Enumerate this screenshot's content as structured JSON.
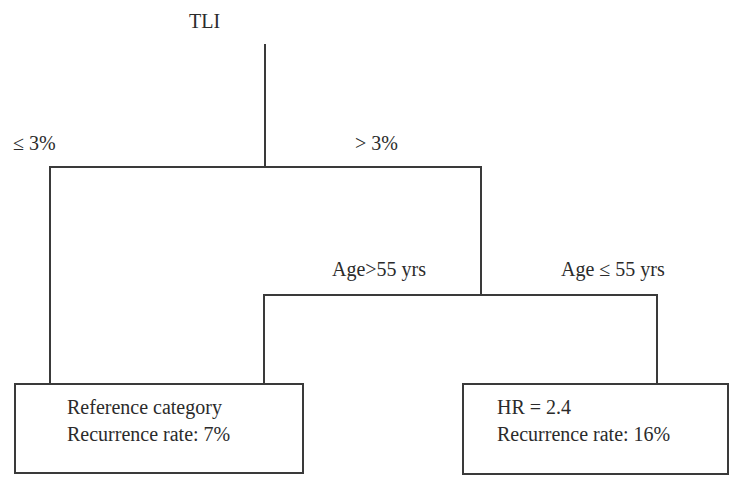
{
  "diagram": {
    "type": "decision-tree",
    "root": {
      "label": "TLI"
    },
    "branches": {
      "tli_low": {
        "label": "≤ 3%"
      },
      "tli_high": {
        "label": "> 3%"
      },
      "age_high": {
        "label": "Age>55 yrs"
      },
      "age_low": {
        "label": "Age ≤ 55 yrs"
      }
    },
    "leaves": [
      {
        "line1": "Reference category",
        "line2": "Recurrence rate: 7%",
        "reached_by": [
          "≤ 3%",
          "> 3% and Age>55 yrs"
        ]
      },
      {
        "line1": "HR = 2.4",
        "line2": "Recurrence rate: 16%",
        "reached_by": [
          "> 3% and Age ≤ 55 yrs"
        ]
      }
    ]
  }
}
